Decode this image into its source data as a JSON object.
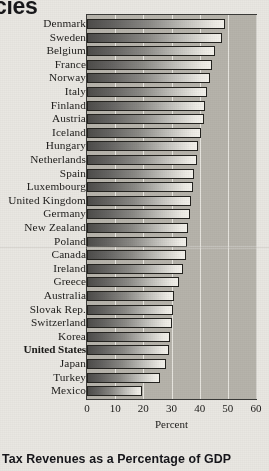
{
  "page_header_fragment": "cies",
  "caption": "Tax Revenues as a Percentage of GDP",
  "chart_data": {
    "type": "bar",
    "orientation": "horizontal",
    "title": "",
    "xlabel": "Percent",
    "ylabel": "",
    "xlim": [
      0,
      60
    ],
    "xticks": [
      0,
      10,
      20,
      30,
      40,
      50,
      60
    ],
    "grid": true,
    "legend": "none",
    "highlight_category": "United States",
    "categories": [
      "Denmark",
      "Sweden",
      "Belgium",
      "France",
      "Norway",
      "Italy",
      "Finland",
      "Austria",
      "Iceland",
      "Hungary",
      "Netherlands",
      "Spain",
      "Luxembourg",
      "United Kingdom",
      "Germany",
      "New Zealand",
      "Poland",
      "Canada",
      "Ireland",
      "Greece",
      "Australia",
      "Slovak Rep.",
      "Switzerland",
      "Korea",
      "United States",
      "Japan",
      "Turkey",
      "Mexico"
    ],
    "values": [
      49.0,
      48.0,
      45.5,
      44.5,
      43.5,
      42.5,
      42.0,
      41.5,
      40.5,
      39.5,
      39.0,
      38.0,
      37.5,
      37.0,
      36.5,
      36.0,
      35.5,
      35.0,
      34.0,
      32.5,
      31.0,
      30.5,
      30.0,
      29.5,
      29.0,
      28.0,
      26.0,
      19.5
    ],
    "units": "percent of GDP"
  },
  "axis": {
    "x_tick_labels": [
      "0",
      "10",
      "20",
      "30",
      "40",
      "50",
      "60"
    ],
    "x_axis_title": "Percent"
  },
  "colors": {
    "plot_background": "#b6b3ab",
    "page_background": "#e9e7e2",
    "gridline": "#f2f0ea",
    "bar_dark": "#4e4d4b",
    "bar_light": "#f3f1eb",
    "text": "#1c1b19"
  }
}
